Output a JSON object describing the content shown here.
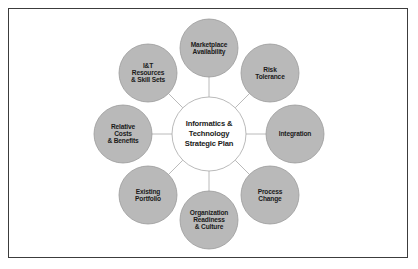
{
  "diagram": {
    "type": "hub-and-spoke",
    "title_node": {
      "id": "hub",
      "label": "Informatics &\nTechnology\nStrategic Plan",
      "cx": 209,
      "cy": 134,
      "r": 37,
      "fill": "#ffffff",
      "stroke": "#a8a8a8"
    },
    "style": {
      "satellite_fill": "#b9b9b9",
      "satellite_stroke": "#9a9a9a",
      "spoke_color": "#a8a8a8",
      "frame_border": "#3c3c3c",
      "background": "#ffffff",
      "text_color": "#1a1a1a"
    },
    "nodes": [
      {
        "id": "marketplace-availability",
        "label": "Marketplace\nAvailability",
        "cx": 209,
        "cy": 48,
        "r": 29
      },
      {
        "id": "risk-tolerance",
        "label": "Risk\nTolerance",
        "cx": 270,
        "cy": 73,
        "r": 29
      },
      {
        "id": "integration",
        "label": "Integration",
        "cx": 295,
        "cy": 134,
        "r": 29
      },
      {
        "id": "process-change",
        "label": "Process\nChange",
        "cx": 270,
        "cy": 195,
        "r": 29
      },
      {
        "id": "organization-readiness-culture",
        "label": "Organization\nReadiness\n& Culture",
        "cx": 209,
        "cy": 220,
        "r": 29
      },
      {
        "id": "existing-portfolio",
        "label": "Existing\nPortfolio",
        "cx": 148,
        "cy": 195,
        "r": 29
      },
      {
        "id": "relative-costs-benefits",
        "label": "Relative\nCosts\n& Benefits",
        "cx": 123,
        "cy": 134,
        "r": 29
      },
      {
        "id": "it-resources-skill-sets",
        "label": "I&T\nResources\n& Skill Sets",
        "cx": 148,
        "cy": 73,
        "r": 29
      }
    ]
  }
}
